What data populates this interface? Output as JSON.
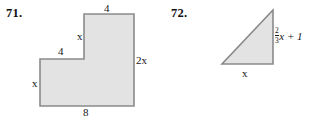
{
  "page": {
    "background_color": "#ffffff",
    "shape_fill_color": "#e3e3e3",
    "shape_stroke_color": "#8a8a8a",
    "text_color": "#141414"
  },
  "problems": [
    {
      "number_label": "71.",
      "shape_name": "l-shaped-polygon",
      "shape_type": "polygon",
      "labels": {
        "top_4": "4",
        "inner_x": "x",
        "mid_4": "4",
        "left_x": "x",
        "right_2x": "2x",
        "bottom_8": "8"
      },
      "dimensions": [
        {
          "side": "top",
          "value": "4"
        },
        {
          "side": "inner-vertical",
          "value": "x"
        },
        {
          "side": "inner-horizontal",
          "value": "4"
        },
        {
          "side": "left",
          "value": "x"
        },
        {
          "side": "right",
          "value": "2x"
        },
        {
          "side": "bottom",
          "value": "8"
        }
      ]
    },
    {
      "number_label": "72.",
      "shape_name": "right-triangle",
      "shape_type": "triangle",
      "labels": {
        "base_x": "x",
        "height_fraction_numerator": "2",
        "height_fraction_denominator": "3",
        "height_rest": "x + 1",
        "height_full": "2/3 x + 1"
      },
      "dimensions": [
        {
          "side": "base",
          "value": "x"
        },
        {
          "side": "height",
          "value": "2/3 x + 1"
        }
      ]
    }
  ]
}
